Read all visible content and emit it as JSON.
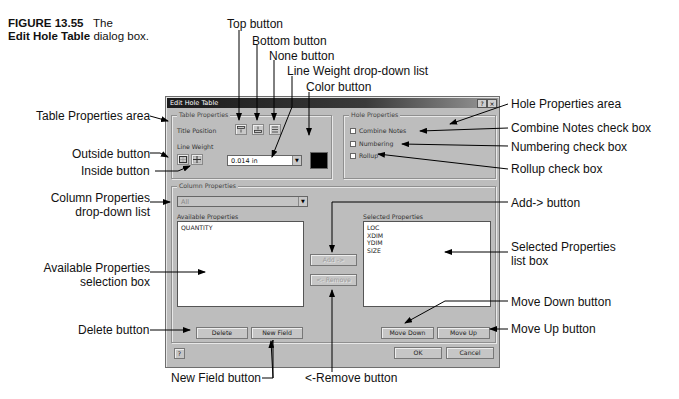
{
  "figure": {
    "number": "FIGURE 13.55",
    "title_prefix": "The",
    "title_bold": "Edit Hole Table",
    "title_suffix": "dialog box."
  },
  "dialog": {
    "title": "Edit Hole Table",
    "titlebar_buttons": {
      "help": "?",
      "close": "×"
    },
    "table_properties": {
      "label": "Table Properties",
      "title_position_label": "Title Position",
      "title_position_buttons": [
        "top-icon",
        "bottom-icon",
        "none-icon"
      ],
      "line_weight_label": "Line Weight",
      "line_weight_buttons": [
        "outside-border-icon",
        "inside-border-icon"
      ],
      "line_weight_value": "0.014 in",
      "color": "#000000"
    },
    "hole_properties": {
      "label": "Hole Properties",
      "checkboxes": [
        {
          "label": "Combine Notes",
          "checked": false
        },
        {
          "label": "Numbering",
          "checked": false
        },
        {
          "label": "Rollup",
          "checked": false
        }
      ]
    },
    "column_properties": {
      "label": "Column Properties",
      "dropdown_value": "All",
      "available_label": "Available Properties",
      "available_items": [
        "QUANTITY"
      ],
      "selected_label": "Selected Properties",
      "selected_items": [
        "LOC",
        "XDIM",
        "YDIM",
        "SIZE"
      ],
      "add_button": "Add ->",
      "remove_button": "<- Remove",
      "delete_button": "Delete",
      "new_field_button": "New Field",
      "move_down_button": "Move Down",
      "move_up_button": "Move Up"
    },
    "footer": {
      "help_button": "?",
      "ok_button": "OK",
      "cancel_button": "Cancel"
    }
  },
  "callouts": {
    "top_button": "Top button",
    "bottom_button": "Bottom button",
    "none_button": "None button",
    "line_weight_dropdown": "Line Weight drop-down list",
    "color_button": "Color button",
    "table_properties_area": "Table Properties area",
    "outside_button": "Outside button",
    "inside_button": "Inside button",
    "column_properties_line1": "Column Properties",
    "column_properties_line2": "drop-down list",
    "available_properties_line1": "Available Properties",
    "available_properties_line2": "selection box",
    "delete_button": "Delete button",
    "new_field_button": "New Field button",
    "remove_button": "<-Remove button",
    "hole_properties_area": "Hole Properties area",
    "combine_notes": "Combine Notes check box",
    "numbering": "Numbering check box",
    "rollup": "Rollup check box",
    "add_button": "Add-> button",
    "selected_properties_line1": "Selected Properties",
    "selected_properties_line2": "list box",
    "move_down_button": "Move Down button",
    "move_up_button": "Move Up button"
  }
}
